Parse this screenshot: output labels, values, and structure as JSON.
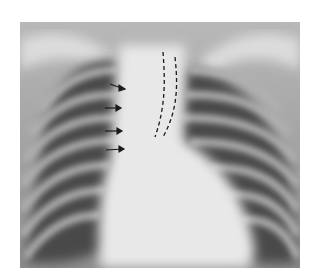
{
  "image": {
    "type": "chest-radiograph",
    "view": "frontal",
    "annotations": {
      "arrows": [
        {
          "x1": 104,
          "y1": 83,
          "x2": 125,
          "y2": 89
        },
        {
          "x1": 100,
          "y1": 108,
          "x2": 120,
          "y2": 108
        },
        {
          "x1": 100,
          "y1": 131,
          "x2": 122,
          "y2": 131
        },
        {
          "x1": 100,
          "y1": 150,
          "x2": 124,
          "y2": 149
        }
      ],
      "dashed_lines": [
        {
          "path": "M163 52 C165 80 166 105 155 137"
        },
        {
          "path": "M175 57 C178 85 178 110 163 137"
        }
      ]
    },
    "colors": {
      "background": "#ffffff",
      "bone_light": "#e6e6e6",
      "lung_dark": "#3a3a3a",
      "annotation": "#1a1a1a"
    }
  }
}
